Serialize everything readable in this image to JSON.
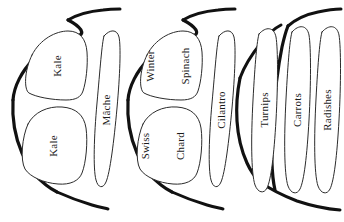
{
  "diagram": {
    "style": "hand-drawn outline sketch",
    "ink_color": "#111111",
    "plot_outline_color": "#2b2b2b",
    "background_color": "#ffffff",
    "label_orientation": "rotated-90-counterclockwise",
    "beds": [
      {
        "id": "bed-left",
        "name": "left-bed",
        "plots": [
          {
            "id": "plot-kale-top",
            "label": "Kale",
            "shape": "rounded-square",
            "lines": [
              "Kale"
            ]
          },
          {
            "id": "plot-kale-bottom",
            "label": "Kale",
            "shape": "rounded-square",
            "lines": [
              "Kale"
            ]
          },
          {
            "id": "plot-mache",
            "label": "Mâche",
            "shape": "narrow-oval",
            "lines": [
              "Mâche"
            ]
          }
        ]
      },
      {
        "id": "bed-middle",
        "name": "middle-bed",
        "plots": [
          {
            "id": "plot-winter-spinach",
            "label": "Winter Spinach",
            "shape": "rounded-square",
            "lines": [
              "Winter",
              "Spinach"
            ]
          },
          {
            "id": "plot-swiss-chard",
            "label": "Swiss Chard",
            "shape": "rounded-square",
            "lines": [
              "Swiss",
              "Chard"
            ]
          },
          {
            "id": "plot-cilantro",
            "label": "Cilantro",
            "shape": "narrow-oval",
            "lines": [
              "Cilantro"
            ]
          }
        ]
      },
      {
        "id": "bed-right",
        "name": "right-bed",
        "plots": [
          {
            "id": "plot-turnips",
            "label": "Turnips",
            "shape": "narrow-oval",
            "lines": [
              "Turnips"
            ]
          },
          {
            "id": "plot-carrots",
            "label": "Carrots",
            "shape": "narrow-oval",
            "lines": [
              "Carrots"
            ]
          },
          {
            "id": "plot-radishes",
            "label": "Radishes",
            "shape": "narrow-oval",
            "lines": [
              "Radishes"
            ]
          }
        ]
      }
    ]
  },
  "labels": {
    "kale_top": "Kale",
    "kale_bottom": "Kale",
    "mache": "Mâche",
    "winter_spinach_line1": "Winter",
    "winter_spinach_line2": "Spinach",
    "swiss_chard_line1": "Swiss",
    "swiss_chard_line2": "Chard",
    "cilantro": "Cilantro",
    "turnips": "Turnips",
    "carrots": "Carrots",
    "radishes": "Radishes"
  }
}
